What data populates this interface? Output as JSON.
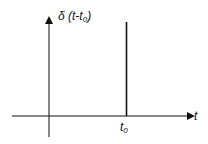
{
  "diagram": {
    "y_axis_label": "δ (t-t",
    "y_axis_label_sub": "0",
    "y_axis_label_close": ")",
    "x_axis_label": "t",
    "impulse_label": "t",
    "impulse_label_sub": "0",
    "colors": {
      "stroke": "#111111",
      "background": "#ffffff"
    }
  }
}
